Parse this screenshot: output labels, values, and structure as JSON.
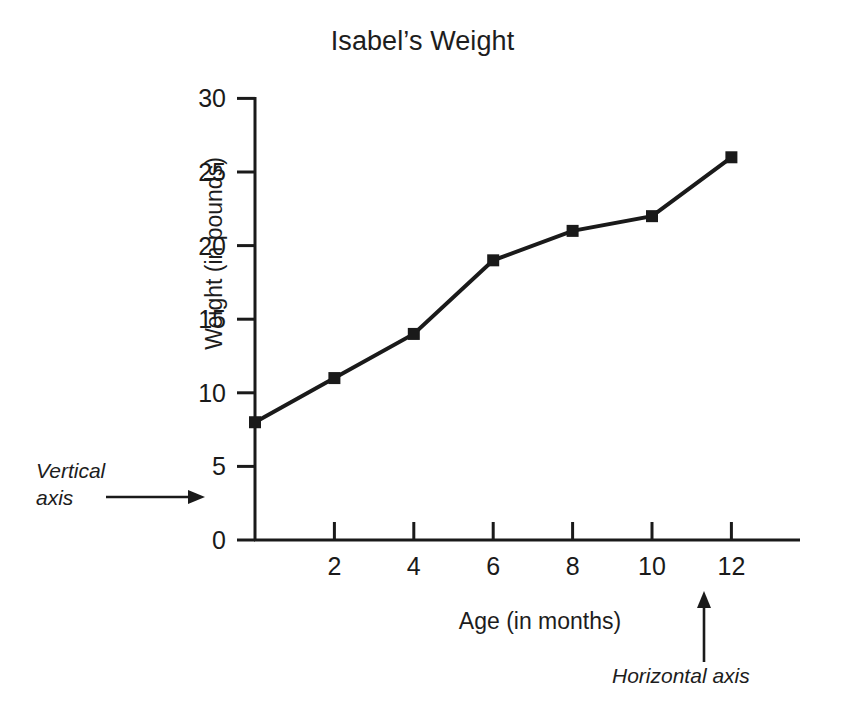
{
  "chart_data": {
    "type": "line",
    "title": "Isabel’s Weight",
    "xlabel": "Age (in months)",
    "ylabel": "Weight (in pounds)",
    "x": [
      0,
      2,
      4,
      6,
      8,
      10,
      12
    ],
    "values": [
      8,
      11,
      14,
      19,
      21,
      22,
      26
    ],
    "series": [
      {
        "name": "Isabel’s Weight",
        "values": [
          8,
          11,
          14,
          19,
          21,
          22,
          26
        ]
      }
    ],
    "xlim": [
      0,
      13.6
    ],
    "ylim": [
      0,
      30
    ],
    "xticks": [
      2,
      4,
      6,
      8,
      10,
      12
    ],
    "xtick_labels": [
      "2",
      "4",
      "6",
      "8",
      "10",
      "12"
    ],
    "yticks": [
      0,
      5,
      10,
      15,
      20,
      25,
      30
    ],
    "ytick_labels": [
      "0",
      "5",
      "10",
      "15",
      "20",
      "25",
      "30"
    ],
    "grid": false,
    "legend": "none",
    "marker": "square",
    "line_color": "#1a1a1a",
    "marker_color": "#1a1a1a",
    "annotations": [
      {
        "id": "vertical-axis",
        "text_line1": "Vertical",
        "text_line2": "axis",
        "arrow": "right"
      },
      {
        "id": "horizontal-axis",
        "text_line1": "Horizontal axis",
        "arrow": "up"
      }
    ]
  },
  "colors": {
    "ink": "#1a1a1a",
    "background": "#ffffff"
  }
}
